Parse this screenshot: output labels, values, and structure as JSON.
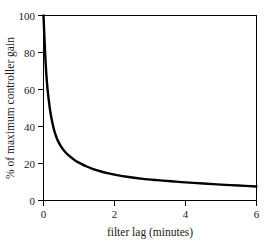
{
  "chart_data": {
    "type": "line",
    "title": "",
    "xlabel": "filter lag (minutes)",
    "ylabel": "% of maximum controller gain",
    "xlim": [
      0,
      6
    ],
    "ylim": [
      0,
      100
    ],
    "xticks": [
      0,
      2,
      4,
      6
    ],
    "xtick_labels": [
      "0",
      "2",
      "4",
      "6"
    ],
    "yticks": [
      0,
      20,
      40,
      60,
      80,
      100
    ],
    "ytick_labels": [
      "0",
      "20",
      "40",
      "60",
      "80",
      "100"
    ],
    "grid": false,
    "legend": false,
    "legend_position": "none",
    "line_color": "#000000",
    "line_width": 2.4,
    "series": [
      {
        "name": "controller gain vs filter lag",
        "x": [
          0,
          0.05,
          0.1,
          0.15,
          0.2,
          0.25,
          0.3,
          0.35,
          0.4,
          0.5,
          0.6,
          0.7,
          0.8,
          0.9,
          1.0,
          1.2,
          1.4,
          1.6,
          1.8,
          2.0,
          2.4,
          2.8,
          3.2,
          3.6,
          4.0,
          4.5,
          5.0,
          5.5,
          6.0
        ],
        "values": [
          100,
          78,
          63,
          54,
          47,
          42,
          38,
          35,
          32.5,
          29,
          26.5,
          24.5,
          23,
          21.5,
          20.5,
          18.5,
          17,
          15.8,
          14.8,
          14,
          12.7,
          11.7,
          11,
          10.4,
          9.8,
          9.2,
          8.6,
          8.1,
          7.6
        ]
      }
    ]
  },
  "axes": {
    "frame_color": "#000000",
    "background": "#ffffff"
  }
}
